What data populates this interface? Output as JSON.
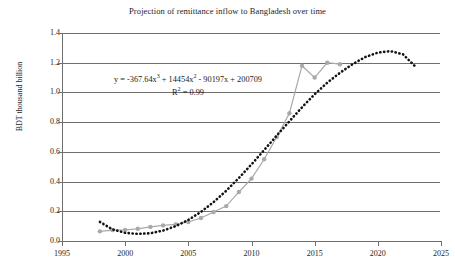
{
  "chart_data": {
    "type": "line",
    "title": "Projection of remittance inflow to Bangladesh over time",
    "xlabel": "",
    "ylabel": "BDT thousand billion",
    "xlim": [
      1995,
      2025
    ],
    "ylim": [
      0.0,
      1.4
    ],
    "xticks": [
      1995,
      2000,
      2005,
      2010,
      2015,
      2020,
      2025
    ],
    "yticks": [
      "0.0",
      "0.2",
      "0.4",
      "0.6",
      "0.8",
      "1.0",
      "1.2",
      "1.4"
    ],
    "grid": "horizontal",
    "legend": "none",
    "annotations": {
      "equation_prefix": "y = -367.64x",
      "equation_exp1": "3",
      "equation_mid1": " + 14454x",
      "equation_exp2": "2",
      "equation_mid2": " - 90197x + 200709",
      "r2_prefix": "R",
      "r2_exp": "2",
      "r2_value": " = 0.99"
    },
    "series": [
      {
        "name": "Actual remittance inflow",
        "style": "line-with-round-markers",
        "color": "#a9a9a9",
        "x": [
          1998,
          1999,
          2000,
          2001,
          2002,
          2003,
          2004,
          2005,
          2006,
          2007,
          2008,
          2009,
          2010,
          2011,
          2012,
          2013,
          2014,
          2015,
          2016,
          2017
        ],
        "values": [
          0.065,
          0.073,
          0.075,
          0.082,
          0.095,
          0.105,
          0.112,
          0.128,
          0.155,
          0.195,
          0.235,
          0.33,
          0.42,
          0.55,
          0.7,
          0.86,
          1.18,
          1.1,
          1.2,
          1.19
        ]
      },
      {
        "name": "Cubic polynomial trendline (projection)",
        "style": "dotted",
        "color": "#141414",
        "x": [
          1998,
          1999,
          2000,
          2001,
          2002,
          2003,
          2004,
          2005,
          2006,
          2007,
          2008,
          2009,
          2010,
          2011,
          2012,
          2013,
          2014,
          2015,
          2016,
          2017,
          2018,
          2019,
          2020,
          2021,
          2022,
          2023
        ],
        "values": [
          0.128,
          0.078,
          0.055,
          0.048,
          0.052,
          0.07,
          0.1,
          0.142,
          0.196,
          0.262,
          0.338,
          0.424,
          0.516,
          0.612,
          0.71,
          0.806,
          0.9,
          0.988,
          1.066,
          1.132,
          1.19,
          1.238,
          1.268,
          1.278,
          1.256,
          1.172
        ]
      }
    ]
  }
}
